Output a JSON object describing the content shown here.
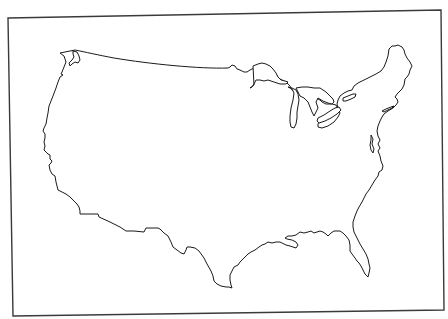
{
  "map": {
    "subject": "Contiguous United States outline",
    "style": "blank outline map",
    "labels": [],
    "colors": {
      "background": "#ffffff",
      "outline": "#1a1a1a",
      "frame": "#3a3a3a"
    },
    "features": [
      {
        "name": "Contiguous United States",
        "type": "country-outline"
      },
      {
        "name": "Lake Superior",
        "type": "lake"
      },
      {
        "name": "Lake Michigan",
        "type": "lake"
      },
      {
        "name": "Lake Huron",
        "type": "lake"
      },
      {
        "name": "Lake Erie",
        "type": "lake"
      },
      {
        "name": "Lake Ontario",
        "type": "lake"
      }
    ]
  }
}
